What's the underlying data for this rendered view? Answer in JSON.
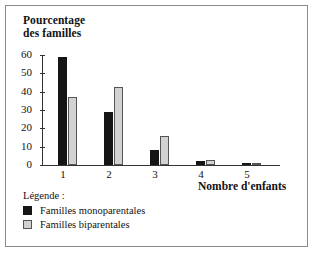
{
  "chart_data": {
    "type": "bar",
    "title": "",
    "ylabel": "Pourcentage des familles",
    "xlabel": "Nombre d'enfants",
    "categories": [
      "1",
      "2",
      "3",
      "4",
      "5"
    ],
    "yticks": [
      "0",
      "10",
      "20",
      "30",
      "40",
      "50",
      "60"
    ],
    "ylim": [
      0,
      60
    ],
    "grid": false,
    "legend_position": "below-left",
    "series": [
      {
        "name": "Familles monoparentales",
        "color": "#151515",
        "values": [
          59,
          29,
          8,
          2,
          0.7
        ]
      },
      {
        "name": "Familles biparentales",
        "color": "#d2d2d2",
        "values": [
          37,
          42.5,
          16,
          3,
          0.7
        ]
      }
    ]
  },
  "legend": {
    "title": "Légende :",
    "items": [
      {
        "label": "Familles monoparentales",
        "swatch": "dark"
      },
      {
        "label": "Familles biparentales",
        "swatch": "light"
      }
    ]
  },
  "axis_titles": {
    "y_line1": "Pourcentage",
    "y_line2": "des familles",
    "x": "Nombre d'enfants"
  }
}
